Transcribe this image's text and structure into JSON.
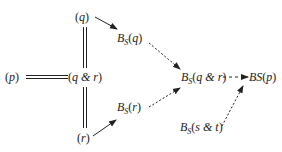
{
  "diagram": {
    "nodes": {
      "q": {
        "open": "(",
        "var": "q",
        "close": ")"
      },
      "p": {
        "open": "(",
        "var": "p",
        "close": ")"
      },
      "qr": {
        "open": "(",
        "var": "q & r",
        "close": ")"
      },
      "r": {
        "open": "(",
        "var": "r",
        "close": ")"
      },
      "bsq": {
        "b": "B",
        "s": "S",
        "open": "(",
        "var": "q",
        "close": ")"
      },
      "bsr": {
        "b": "B",
        "s": "S",
        "open": "(",
        "var": "r",
        "close": ")"
      },
      "bsqr": {
        "b": "B",
        "s": "S",
        "open": "(",
        "var": "q & r",
        "close": ")"
      },
      "bsp": {
        "b": "BS",
        "open": "(",
        "var": "p",
        "close": ")"
      },
      "bsst": {
        "b": "B",
        "s": "S",
        "open": "(",
        "var": "s & t",
        "close": ")"
      }
    },
    "edges": [
      {
        "from": "p",
        "to": "qr",
        "style": "double"
      },
      {
        "from": "q",
        "to": "qr",
        "style": "double"
      },
      {
        "from": "r",
        "to": "qr",
        "style": "double"
      },
      {
        "from": "q",
        "to": "bsq",
        "style": "solid-arrow"
      },
      {
        "from": "r",
        "to": "bsr",
        "style": "solid-arrow"
      },
      {
        "from": "bsq",
        "to": "bsqr",
        "style": "dotted-arrow"
      },
      {
        "from": "bsr",
        "to": "bsqr",
        "style": "dotted-arrow"
      },
      {
        "from": "bsqr",
        "to": "bsp",
        "style": "dashed-arrow"
      },
      {
        "from": "bsst",
        "to": "bsp",
        "style": "dotted-arrow"
      }
    ],
    "colors": {
      "ink": "#222222",
      "background": "#ffffff"
    }
  }
}
